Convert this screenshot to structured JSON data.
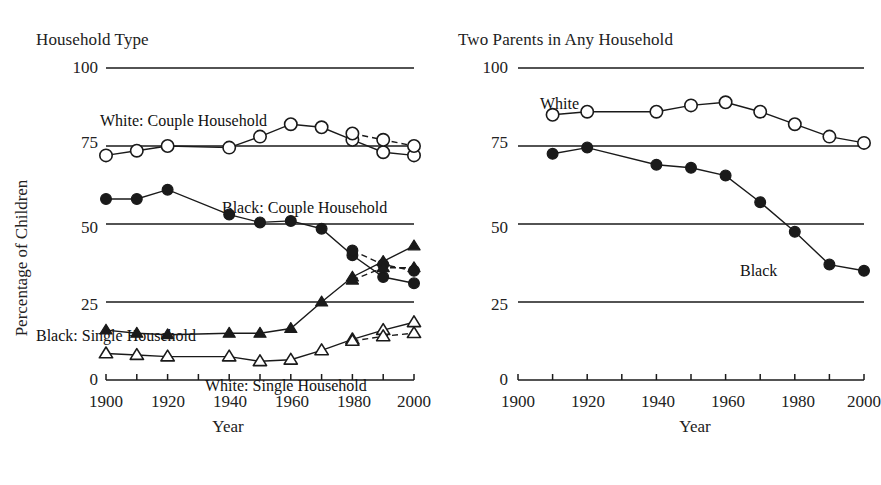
{
  "figure": {
    "width": 875,
    "height": 485,
    "background": "#ffffff",
    "ink_color": "#1a1a1a"
  },
  "panels": {
    "left": {
      "title": "Household Type",
      "ylabel": "Percentage of Children",
      "xlabel": "Year",
      "yticks": [
        "100",
        "75",
        "50",
        "25",
        "0"
      ],
      "xticks": [
        "1900",
        "1920",
        "1940",
        "1960",
        "1980",
        "2000"
      ],
      "series_labels": [
        {
          "text": "White: Couple Household",
          "x": 100,
          "y": 112
        },
        {
          "text": "Black: Couple Household",
          "x": 222,
          "y": 199
        },
        {
          "text": "Black: Single Household",
          "x": 36,
          "y": 327
        },
        {
          "text": "White: Single Household",
          "x": 205,
          "y": 377
        }
      ]
    },
    "right": {
      "title": "Two Parents in Any Household",
      "xlabel": "Year",
      "yticks": [
        "100",
        "75",
        "50",
        "25",
        "0"
      ],
      "xticks": [
        "1900",
        "1920",
        "1940",
        "1960",
        "1980",
        "2000"
      ],
      "series_labels": [
        {
          "text": "White",
          "x": 90,
          "y": 95
        },
        {
          "text": "Black",
          "x": 290,
          "y": 262
        }
      ]
    }
  },
  "chart_data": [
    {
      "id": "household-type",
      "type": "line",
      "title": "Household Type",
      "xlabel": "Year",
      "ylabel": "Percentage of Children",
      "xlim": [
        1900,
        2000
      ],
      "ylim": [
        0,
        100
      ],
      "xticks": [
        1900,
        1920,
        1940,
        1960,
        1980,
        2000
      ],
      "yticks": [
        0,
        25,
        50,
        75,
        100
      ],
      "minor_xtick_step": 10,
      "grid": "horizontal-gridlines-at-yticks",
      "legend": "inline-annotations",
      "series": [
        {
          "name": "White: Couple Household",
          "marker": "open-circle",
          "linestyle": "solid",
          "x": [
            1900,
            1910,
            1920,
            1940,
            1950,
            1960,
            1970,
            1980,
            1990,
            2000
          ],
          "values": [
            72,
            73.5,
            75,
            74.5,
            78,
            82,
            81,
            77,
            73,
            72
          ]
        },
        {
          "name": "White: Couple Household (alternate source)",
          "marker": "open-circle",
          "linestyle": "dashed",
          "x": [
            1980,
            1990,
            2000
          ],
          "values": [
            79,
            77,
            75
          ]
        },
        {
          "name": "Black: Couple Household",
          "marker": "filled-circle",
          "linestyle": "solid",
          "x": [
            1900,
            1910,
            1920,
            1940,
            1950,
            1960,
            1970,
            1980,
            1990,
            2000
          ],
          "values": [
            58,
            58,
            61,
            53,
            50.5,
            51,
            48.5,
            40,
            33,
            31
          ]
        },
        {
          "name": "Black: Couple Household (alternate source)",
          "marker": "filled-circle",
          "linestyle": "dashed",
          "x": [
            1980,
            1990,
            2000
          ],
          "values": [
            41.5,
            37,
            35
          ]
        },
        {
          "name": "Black: Single Household",
          "marker": "filled-triangle",
          "linestyle": "solid",
          "x": [
            1900,
            1910,
            1920,
            1940,
            1950,
            1960,
            1970,
            1980,
            1990,
            2000
          ],
          "values": [
            16,
            15,
            14.5,
            15,
            15,
            16.5,
            25,
            33,
            38,
            43
          ]
        },
        {
          "name": "Black: Single Household (alternate source)",
          "marker": "filled-triangle",
          "linestyle": "dashed",
          "x": [
            1980,
            1990,
            2000
          ],
          "values": [
            32,
            36,
            36
          ]
        },
        {
          "name": "White: Single Household",
          "marker": "open-triangle",
          "linestyle": "solid",
          "x": [
            1900,
            1910,
            1920,
            1940,
            1950,
            1960,
            1970,
            1980,
            1990,
            2000
          ],
          "values": [
            8.5,
            8,
            7.5,
            7.5,
            6,
            6.5,
            9.5,
            13,
            16,
            18.5
          ]
        },
        {
          "name": "White: Single Household (alternate source)",
          "marker": "open-triangle",
          "linestyle": "dashed",
          "x": [
            1980,
            1990,
            2000
          ],
          "values": [
            12.5,
            14,
            15
          ]
        }
      ]
    },
    {
      "id": "two-parents-any-household",
      "type": "line",
      "title": "Two Parents in Any Household",
      "xlabel": "Year",
      "ylabel": "",
      "xlim": [
        1900,
        2000
      ],
      "ylim": [
        0,
        100
      ],
      "xticks": [
        1900,
        1920,
        1940,
        1960,
        1980,
        2000
      ],
      "yticks": [
        0,
        25,
        50,
        75,
        100
      ],
      "minor_xtick_step": 10,
      "grid": "horizontal-gridlines-at-yticks",
      "legend": "inline-annotations",
      "series": [
        {
          "name": "White",
          "marker": "open-circle",
          "linestyle": "solid",
          "x": [
            1910,
            1920,
            1940,
            1950,
            1960,
            1970,
            1980,
            1990,
            2000
          ],
          "values": [
            85,
            86,
            86,
            88,
            89,
            86,
            82,
            78,
            76
          ]
        },
        {
          "name": "Black",
          "marker": "filled-circle",
          "linestyle": "solid",
          "x": [
            1910,
            1920,
            1940,
            1950,
            1960,
            1970,
            1980,
            1990,
            2000
          ],
          "values": [
            72.5,
            74.5,
            69,
            68,
            65.5,
            57,
            47.5,
            37,
            35
          ]
        }
      ]
    }
  ]
}
